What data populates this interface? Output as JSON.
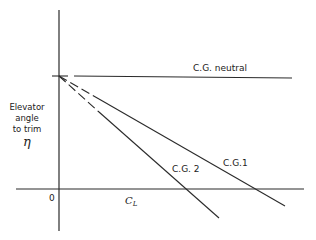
{
  "diagram": {
    "title": "",
    "colors": {
      "line": "#2a2a2a",
      "text": "#222222",
      "background": "#ffffff"
    },
    "y_axis": {
      "label_lines": [
        "Elevator",
        "angle",
        "to trim"
      ],
      "symbol": "η"
    },
    "x_axis": {
      "label": "C",
      "label_subscript": "L",
      "origin_label": "0"
    },
    "lines": [
      {
        "id": "cg-neutral",
        "label": "C.G. neutral",
        "slope": "zero",
        "style": "dashed near origin then solid"
      },
      {
        "id": "cg-1",
        "label": "C.G.1",
        "slope": "negative (shallower)",
        "style": "dashed near origin then solid"
      },
      {
        "id": "cg-2",
        "label": "C.G. 2",
        "slope": "negative (steeper)",
        "style": "dashed near origin then solid"
      }
    ]
  }
}
